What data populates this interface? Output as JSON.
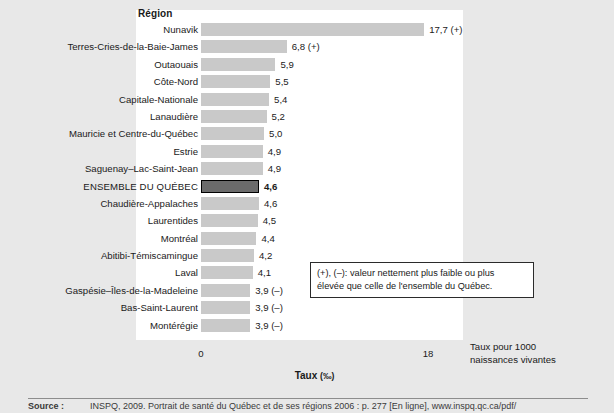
{
  "header": {
    "column_title": "Région"
  },
  "axis": {
    "title": "Taux",
    "unit": "(‰)",
    "ticks": [
      {
        "label": "0",
        "value": 0
      },
      {
        "label": "18",
        "value": 18
      }
    ]
  },
  "side_note": {
    "line1": "Taux pour 1000",
    "line2": "naissances vivantes"
  },
  "legend": {
    "line1": "(+), (–): valeur nettement plus faible ou plus",
    "line2": "élevée que celle de l'ensemble du Québec."
  },
  "footer": {
    "source_label": "Source :",
    "text": "INSPQ, 2009. Portrait de santé du Québec et de ses régions 2006 : p. 277 [En ligne], www.inspq.qc.ca/pdf/"
  },
  "chart_data": {
    "type": "bar",
    "orientation": "horizontal",
    "title": "Région",
    "xlabel": "Taux (‰)",
    "ylabel": "Région",
    "xlim": [
      0,
      18
    ],
    "grid": false,
    "legend_position": "inside-right",
    "value_note": "Taux pour 1000 naissances vivantes",
    "categories": [
      "Nunavik",
      "Terres-Cries-de-la-Baie-James",
      "Outaouais",
      "Côte-Nord",
      "Capitale-Nationale",
      "Lanaudière",
      "Mauricie et Centre-du-Québec",
      "Estrie",
      "Saguenay–Lac-Saint-Jean",
      "ENSEMBLE DU QUÉBEC",
      "Chaudière-Appalaches",
      "Laurentides",
      "Montréal",
      "Abitibi-Témiscamingue",
      "Laval",
      "Gaspésie–Îles-de-la-Madeleine",
      "Bas-Saint-Laurent",
      "Montérégie"
    ],
    "values": [
      17.7,
      6.8,
      5.9,
      5.5,
      5.4,
      5.2,
      5.0,
      4.9,
      4.9,
      4.6,
      4.6,
      4.5,
      4.4,
      4.2,
      4.1,
      3.9,
      3.9,
      3.9
    ],
    "value_labels": [
      "17,7 (+)",
      "6,8 (+)",
      "5,9",
      "5,5",
      "5,4",
      "5,2",
      "5,0",
      "4,9",
      "4,9",
      "4,6",
      "4,6",
      "4,5",
      "4,4",
      "4,2",
      "4,1",
      "3,9 (–)",
      "3,9 (–)",
      "3,9 (–)"
    ],
    "significance": [
      "+",
      "+",
      "",
      "",
      "",
      "",
      "",
      "",
      "",
      "",
      "",
      "",
      "",
      "",
      "",
      "-",
      "-",
      "-"
    ],
    "highlight_index": 9,
    "colors": {
      "bar": "#c9c9c9",
      "highlight_bar": "#6b6b6b",
      "highlight_border": "#000000",
      "panel": "#ffffff",
      "background": "#e8e8e8"
    }
  }
}
